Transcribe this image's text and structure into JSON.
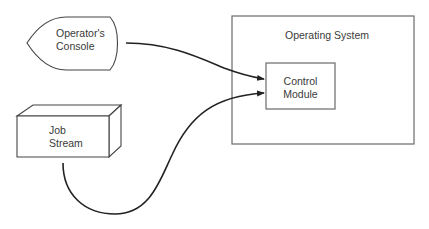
{
  "nodes": {
    "console": {
      "line1": "Operator's",
      "line2": "Console"
    },
    "job_stream": {
      "line1": "Job",
      "line2": "Stream"
    },
    "operating_system": {
      "label": "Operating System"
    },
    "control_module": {
      "line1": "Control",
      "line2": "Module"
    }
  },
  "edges": [
    {
      "from": "Operator's Console",
      "to": "Control Module"
    },
    {
      "from": "Job Stream",
      "to": "Control Module"
    }
  ],
  "colors": {
    "stroke": "#333333",
    "box_stroke": "#6a6a6a",
    "background": "#ffffff"
  }
}
